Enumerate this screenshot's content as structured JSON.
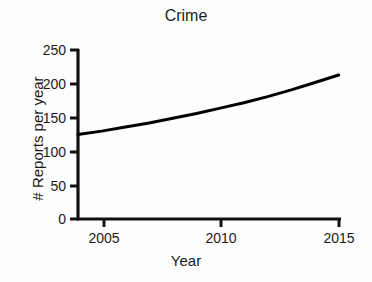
{
  "chart_data": {
    "type": "line",
    "title": "Crime",
    "xlabel": "Year",
    "ylabel": "# Reports per year",
    "xlim": [
      2004,
      2015
    ],
    "ylim": [
      0,
      250
    ],
    "xticks": [
      2005,
      2010,
      2015
    ],
    "xtick_labels": [
      "2005",
      "2010",
      "2015"
    ],
    "yticks": [
      0,
      50,
      100,
      150,
      200,
      250
    ],
    "ytick_labels": [
      "0",
      "50",
      "100",
      "150",
      "200",
      "250"
    ],
    "grid": false,
    "legend": "none",
    "line_color": "#000000",
    "line_width": 3,
    "series": [
      {
        "name": "Crime reports",
        "x": [
          2004,
          2005,
          2006,
          2007,
          2008,
          2009,
          2010,
          2011,
          2012,
          2013,
          2014,
          2015
        ],
        "values": [
          125,
          130,
          136,
          142,
          149,
          156,
          164,
          172,
          181,
          191,
          202,
          213
        ]
      }
    ]
  },
  "axes": {
    "title": "Crime",
    "x_label": "Year",
    "y_label": "# Reports per year"
  },
  "ticks": {
    "y": [
      "250",
      "200",
      "150",
      "100",
      "50",
      "0"
    ],
    "x": [
      "2005",
      "2010",
      "2015"
    ]
  }
}
